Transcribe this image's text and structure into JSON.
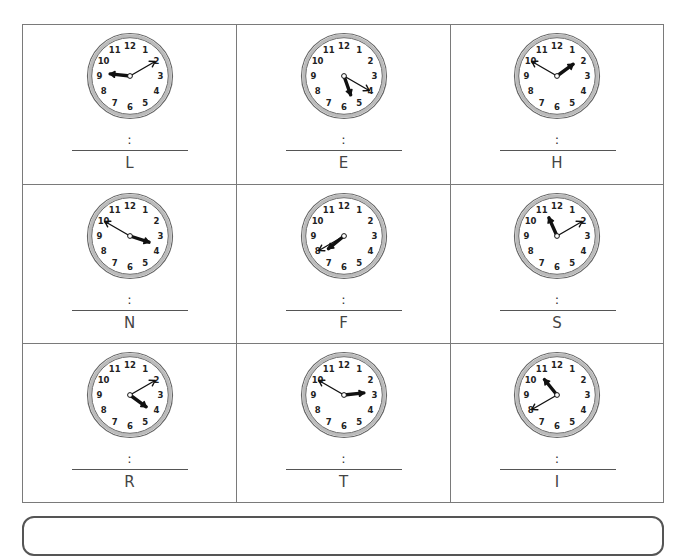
{
  "worksheet": {
    "separator": ":",
    "clocks": [
      {
        "letter": "L",
        "hour_hand": 9.2,
        "minute_hand": 2
      },
      {
        "letter": "E",
        "hour_hand": 5.35,
        "minute_hand": 4
      },
      {
        "letter": "H",
        "hour_hand": 1.8,
        "minute_hand": 10
      },
      {
        "letter": "N",
        "hour_hand": 3.6,
        "minute_hand": 10
      },
      {
        "letter": "F",
        "hour_hand": 7.7,
        "minute_hand": 8
      },
      {
        "letter": "S",
        "hour_hand": 11.2,
        "minute_hand": 2
      },
      {
        "letter": "R",
        "hour_hand": 4.2,
        "minute_hand": 2
      },
      {
        "letter": "T",
        "hour_hand": 2.8,
        "minute_hand": 10
      },
      {
        "letter": "I",
        "hour_hand": 10.7,
        "minute_hand": 8
      }
    ],
    "dial_numbers": [
      "12",
      "1",
      "2",
      "3",
      "4",
      "5",
      "6",
      "7",
      "8",
      "9",
      "10",
      "11"
    ]
  }
}
